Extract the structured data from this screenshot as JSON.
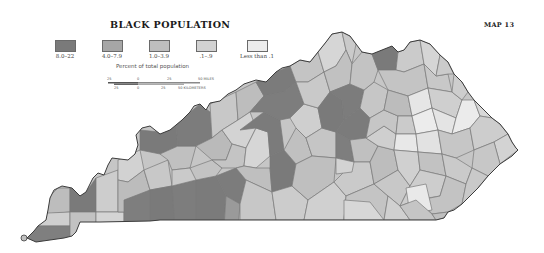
{
  "header": {
    "title": "BLACK POPULATION",
    "map_number": "MAP 13"
  },
  "legend": {
    "items": [
      {
        "label": "8.0–22",
        "color": "#7a7a7a"
      },
      {
        "label": "4.0–7.9",
        "color": "#a6a6a6"
      },
      {
        "label": "1.0–3.9",
        "color": "#bebebe"
      },
      {
        "label": ".1–.9",
        "color": "#d2d2d2"
      },
      {
        "label": "Less than .1",
        "color": "#ececec"
      }
    ],
    "subtitle": "Percent of total population"
  },
  "scale_bar": {
    "miles": {
      "ticks": [
        "25",
        "0",
        "25"
      ],
      "end_label": "50 MILES"
    },
    "kilometers": {
      "ticks": [
        "25",
        "0",
        "25"
      ],
      "end_label": "50 KILOMETERS"
    }
  },
  "map": {
    "region": "Kentucky counties",
    "border_color": "#6e6e6e",
    "outline_color": "#3c3c3c"
  }
}
